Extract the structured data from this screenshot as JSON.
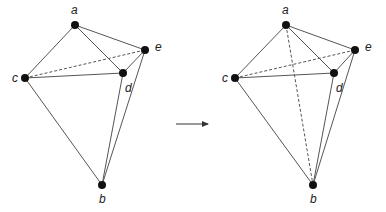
{
  "diagram": {
    "left": {
      "points": {
        "a": {
          "x": 75,
          "y": 25,
          "label": "a",
          "lx": 71,
          "ly": 14
        },
        "b": {
          "x": 102,
          "y": 185,
          "label": "b",
          "lx": 99,
          "ly": 203
        },
        "c": {
          "x": 25,
          "y": 78,
          "label": "c",
          "lx": 12,
          "ly": 82
        },
        "d": {
          "x": 123,
          "y": 73,
          "label": "d",
          "lx": 125,
          "ly": 92
        },
        "e": {
          "x": 145,
          "y": 50,
          "label": "e",
          "lx": 155,
          "ly": 51
        }
      },
      "solid_edges": [
        [
          "a",
          "c"
        ],
        [
          "a",
          "d"
        ],
        [
          "a",
          "e"
        ],
        [
          "c",
          "d"
        ],
        [
          "c",
          "b"
        ],
        [
          "d",
          "e"
        ],
        [
          "d",
          "b"
        ],
        [
          "e",
          "b"
        ]
      ],
      "dashed_edges": [
        [
          "c",
          "e"
        ]
      ]
    },
    "arrow": {
      "x1": 176,
      "y1": 124,
      "x2": 208,
      "y2": 124
    },
    "right": {
      "points": {
        "a": {
          "x": 286,
          "y": 25,
          "label": "a",
          "lx": 282,
          "ly": 14
        },
        "b": {
          "x": 313,
          "y": 185,
          "label": "b",
          "lx": 310,
          "ly": 203
        },
        "c": {
          "x": 235,
          "y": 78,
          "label": "c",
          "lx": 222,
          "ly": 82
        },
        "d": {
          "x": 334,
          "y": 73,
          "label": "d",
          "lx": 336,
          "ly": 92
        },
        "e": {
          "x": 355,
          "y": 50,
          "label": "e",
          "lx": 365,
          "ly": 51
        }
      },
      "solid_edges": [
        [
          "a",
          "c"
        ],
        [
          "a",
          "d"
        ],
        [
          "a",
          "e"
        ],
        [
          "c",
          "d"
        ],
        [
          "c",
          "b"
        ],
        [
          "d",
          "e"
        ],
        [
          "d",
          "b"
        ],
        [
          "e",
          "b"
        ]
      ],
      "dashed_edges": [
        [
          "c",
          "e"
        ],
        [
          "a",
          "b"
        ]
      ]
    },
    "colors": {
      "line": "#555555",
      "node": "#111111",
      "label": "#222222"
    }
  }
}
